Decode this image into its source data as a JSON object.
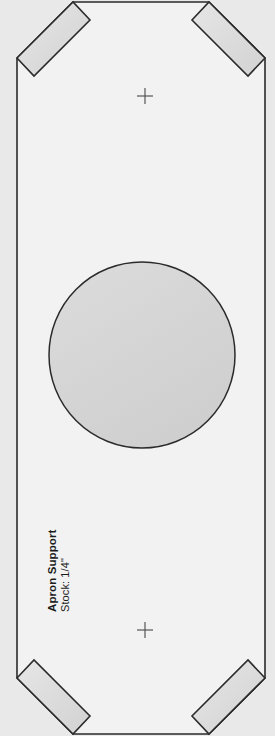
{
  "document": {
    "kind": "woodworking-cut-template",
    "part_title": "Apron Support",
    "stock_note": "Stock: 1/4\"",
    "page_width": 275,
    "page_height": 736
  },
  "colors": {
    "page_background": "#e9e9e9",
    "part_fill": "#f2f2f2",
    "notch_fill": "#dcdcdc",
    "hole_fill": "#d7d7d7",
    "outline": "#2b2b2b",
    "registration_mark": "#555555",
    "text": "#1b1b1b"
  },
  "geometry": {
    "part_outline": {
      "name": "apron-support-outline",
      "left": 17,
      "right": 265,
      "top": 2,
      "bottom": 734,
      "notch_depth": 56,
      "points": "17,58 73,2 209,2 265,58 265,678 209,734 73,734 17,678"
    },
    "notches": [
      {
        "name": "notch-top-left",
        "points": "17,58 73,2 90,20 34,76"
      },
      {
        "name": "notch-top-right",
        "points": "209,2 265,58 248,76 192,20"
      },
      {
        "name": "notch-bottom-left",
        "points": "17,678 34,660 90,716 73,734"
      },
      {
        "name": "notch-bottom-right",
        "points": "265,678 248,660 192,716 209,734"
      }
    ],
    "hole": {
      "name": "center-bore",
      "cx": 142,
      "cy": 355,
      "r": 93
    },
    "registration_marks": [
      {
        "name": "registration-mark-top",
        "cx": 145,
        "cy": 96,
        "size": 16
      },
      {
        "name": "registration-mark-bottom",
        "cx": 145,
        "cy": 630,
        "size": 16
      }
    ]
  }
}
